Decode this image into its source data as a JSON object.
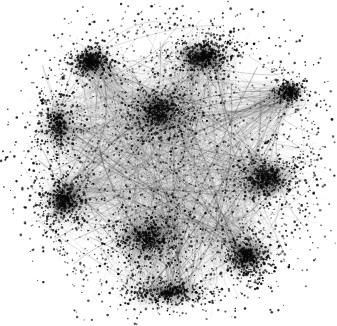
{
  "visualization": {
    "title": "Network Graph Visualization",
    "type": "force-directed-node-link-diagram",
    "render_style": "grayscale-hairball",
    "width": 337,
    "height": 326,
    "background_color": "#ffffff",
    "node_color": "#0a0a0a",
    "edge_color": "#2b2b2b",
    "node_count_label": "",
    "edge_count_label": "",
    "axes_visible": false,
    "legend_visible": false,
    "labels_visible": false
  },
  "chart_data": {
    "type": "scatter",
    "title": "",
    "subtitle": "",
    "xlabel": "",
    "ylabel": "",
    "xlim": [
      0,
      337
    ],
    "ylim": [
      0,
      326
    ],
    "grid": false,
    "legend": "none",
    "blob": {
      "center_x": 172,
      "center_y": 163,
      "radius_x": 158,
      "radius_y": 156
    },
    "clusters": [
      {
        "name": "upper-center-hub",
        "x": 158,
        "y": 112,
        "rx": 30,
        "ry": 26,
        "density": 1.0,
        "darkness": 0.96
      },
      {
        "name": "upper-right-wedge-hub",
        "x": 203,
        "y": 56,
        "rx": 24,
        "ry": 16,
        "density": 0.92,
        "darkness": 0.94
      },
      {
        "name": "upper-left-hub",
        "x": 91,
        "y": 62,
        "rx": 16,
        "ry": 12,
        "density": 0.72,
        "darkness": 0.82
      },
      {
        "name": "left-band-hub",
        "x": 58,
        "y": 124,
        "rx": 16,
        "ry": 26,
        "density": 0.62,
        "darkness": 0.72
      },
      {
        "name": "left-lower-hub",
        "x": 64,
        "y": 200,
        "rx": 18,
        "ry": 20,
        "density": 0.78,
        "darkness": 0.85
      },
      {
        "name": "right-hub",
        "x": 266,
        "y": 178,
        "rx": 28,
        "ry": 20,
        "density": 0.95,
        "darkness": 0.95
      },
      {
        "name": "bottom-center-hub",
        "x": 148,
        "y": 238,
        "rx": 34,
        "ry": 26,
        "density": 1.0,
        "darkness": 0.97
      },
      {
        "name": "bottom-right-hub",
        "x": 247,
        "y": 256,
        "rx": 20,
        "ry": 18,
        "density": 0.8,
        "darkness": 0.88
      },
      {
        "name": "bottom-band-hub",
        "x": 168,
        "y": 292,
        "rx": 34,
        "ry": 12,
        "density": 0.7,
        "darkness": 0.84
      },
      {
        "name": "far-right-sat",
        "x": 290,
        "y": 92,
        "rx": 12,
        "ry": 10,
        "density": 0.45,
        "darkness": 0.6
      }
    ],
    "node_counts": {
      "cluster_nodes": 3400,
      "field_nodes": 1500,
      "outlier_nodes": 420,
      "total": 5320
    },
    "edge_counts": {
      "bundle_edges": 1900,
      "long_range_edges": 260,
      "total": 2160
    }
  }
}
